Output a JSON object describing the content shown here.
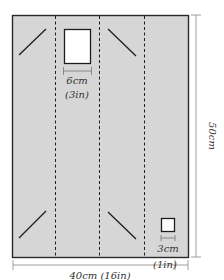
{
  "diagram": {
    "panel": {
      "fill": "#d6d6d6",
      "stroke": "#2a2a2a"
    },
    "dims": {
      "width_label": "40cm (16in)",
      "height_label": "50cm",
      "large_square_cm": "6cm",
      "large_square_in": "(3in)",
      "small_square_cm": "3cm",
      "small_square_in": "(1in)"
    }
  }
}
